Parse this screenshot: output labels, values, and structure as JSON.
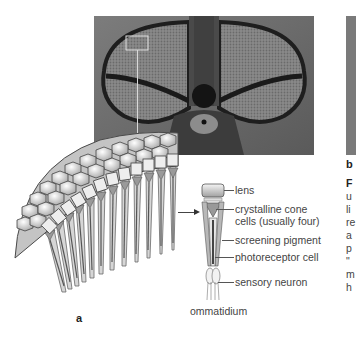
{
  "figure": {
    "panel_a_label": "a",
    "panel_b_label": "b",
    "photo_a": {
      "subject": "compound eyes of a fly (head-on photograph)",
      "highlight_box": "selected region of ommatidia"
    },
    "photo_b": {
      "subject": "partially visible photograph (cropped)"
    },
    "ommatidium_title": "ommatidium",
    "labels": [
      {
        "text": "lens"
      },
      {
        "text": "crystalline cone"
      },
      {
        "text": "cells (usually four)"
      },
      {
        "text": "screening pigment"
      },
      {
        "text": "photoreceptor cell"
      },
      {
        "text": "sensory neuron"
      }
    ],
    "caption_fragments": [
      "F",
      "u",
      "li",
      "re",
      "a",
      "p",
      "\"",
      "m",
      "h"
    ],
    "colors": {
      "photo_dark": "#2a2a2a",
      "photo_mid": "#7a7a7a",
      "diagram_gray": "#9a9a9a",
      "line": "#555555"
    }
  }
}
